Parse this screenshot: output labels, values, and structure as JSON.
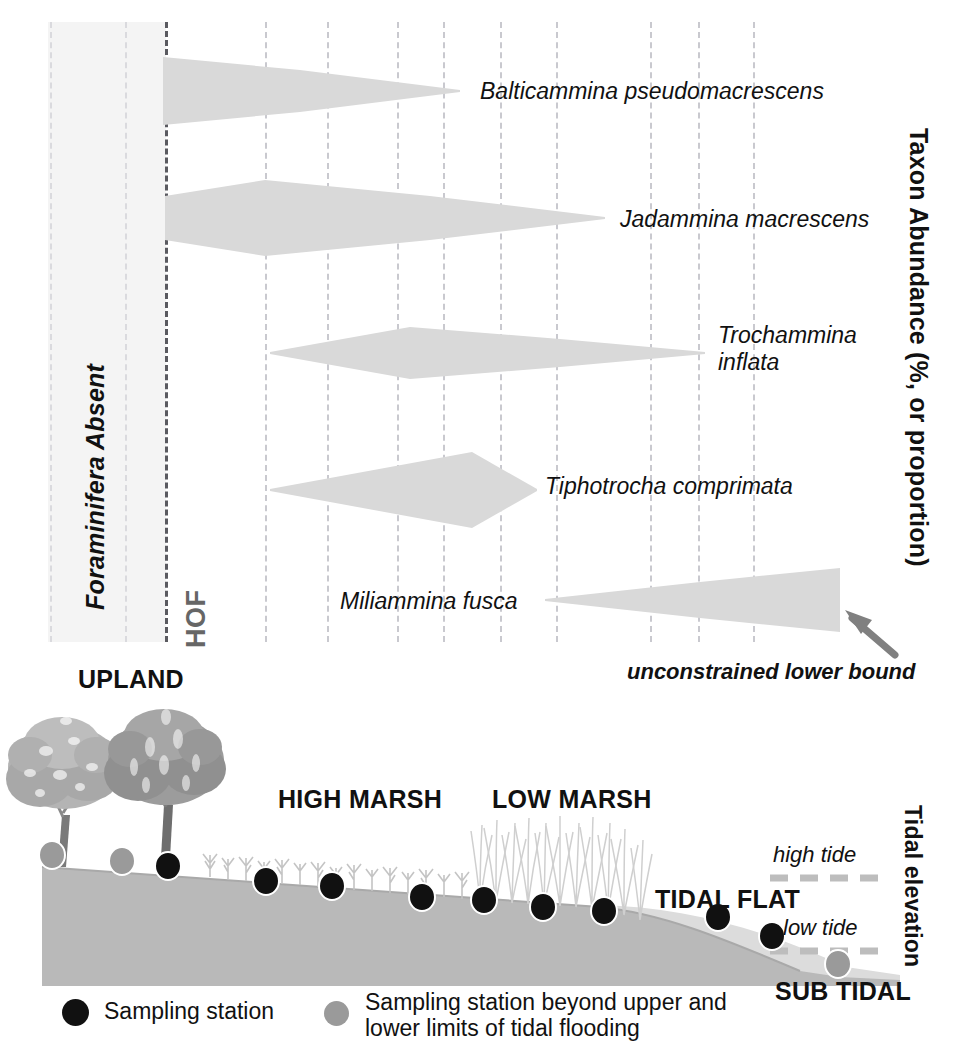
{
  "figure": {
    "title_internal": "Salt marsh foraminiferal zonation and tidal elevation cross-section"
  },
  "top_panel": {
    "absent_zone_label": "Foraminifera Absent",
    "hof_label": "HOF",
    "y_axis_label": "Taxon Abundance (%, or proportion)",
    "annotation": "unconstrained lower bound",
    "species": [
      {
        "name": "Balticammina pseudomacrescens",
        "label_lines": [
          "Balticammina pseudomacrescens"
        ]
      },
      {
        "name": "Jadammina macrescens",
        "label_lines": [
          "Jadammina macrescens"
        ]
      },
      {
        "name": "Trochammina inflata",
        "label_lines": [
          "Trochammina",
          "inflata"
        ]
      },
      {
        "name": "Tiphotrocha comprimata",
        "label_lines": [
          "Tiphotrocha comprimata"
        ]
      },
      {
        "name": "Miliammina fusca",
        "label_lines": [
          "Miliammina fusca"
        ]
      }
    ]
  },
  "bottom_panel": {
    "zone_labels": [
      "UPLAND",
      "HIGH MARSH",
      "LOW MARSH",
      "TIDAL FLAT",
      "SUB TIDAL"
    ],
    "tide_labels": [
      "high tide",
      "low tide"
    ],
    "y_axis_label": "Tidal elevation"
  },
  "legend": {
    "items": [
      {
        "marker": "black-dot",
        "text": "Sampling station"
      },
      {
        "marker": "grey-dot",
        "text_line1": "Sampling station beyond upper and",
        "text_line2": "lower limits of tidal flooding"
      }
    ]
  },
  "colors": {
    "taxon_fill": "#d9d9d9",
    "absent_band": "#f4f4f4",
    "gridline": "#c9c9cf",
    "hof_line": "#5a5a60",
    "marsh_body": "#b8b8b8",
    "tidal_flat": "#d2d2d2",
    "station_black": "#111111",
    "station_grey": "#9a9a9a",
    "arrow": "#808080",
    "tree_light": "#a8a8a8",
    "tree_dark": "#8a8a8a"
  },
  "chart_data": {
    "type": "area",
    "xlabel": "",
    "ylabel": "Taxon Abundance (%, or proportion)",
    "x_axis_note": "Tidal elevation decreasing left-to-right (upland to sub tidal)",
    "grid": true,
    "legend_position": "inline-right-labels",
    "gridline_x_positions": [
      50,
      125,
      165,
      265,
      327,
      397,
      443,
      500,
      556,
      650,
      698,
      753
    ],
    "hof_x": 165,
    "absent_zone_x_range": [
      48,
      165
    ],
    "series": [
      {
        "name": "Balticammina pseudomacrescens",
        "comment": "wedge: widest at HOF, tapers to zero seaward",
        "envelope": [
          {
            "x": 163,
            "half_width": 34
          },
          {
            "x": 300,
            "half_width": 21
          },
          {
            "x": 460,
            "half_width": 1
          }
        ],
        "center_y": 91
      },
      {
        "name": "Jadammina macrescens",
        "comment": "broad lens peaking just seaward of HOF",
        "envelope": [
          {
            "x": 165,
            "half_width": 22
          },
          {
            "x": 265,
            "half_width": 38
          },
          {
            "x": 430,
            "half_width": 22
          },
          {
            "x": 605,
            "half_width": 1
          }
        ],
        "center_y": 218
      },
      {
        "name": "Trochammina inflata",
        "comment": "elongate lens across mid marsh",
        "envelope": [
          {
            "x": 270,
            "half_width": 1
          },
          {
            "x": 410,
            "half_width": 26
          },
          {
            "x": 560,
            "half_width": 14
          },
          {
            "x": 705,
            "half_width": 1
          }
        ],
        "center_y": 353
      },
      {
        "name": "Tiphotrocha comprimata",
        "comment": "asymmetric lens peaking in low marsh",
        "envelope": [
          {
            "x": 270,
            "half_width": 1
          },
          {
            "x": 472,
            "half_width": 38
          },
          {
            "x": 537,
            "half_width": 1
          }
        ],
        "center_y": 490
      },
      {
        "name": "Miliammina fusca",
        "comment": "expanding wedge toward sub tidal, right edge unconstrained",
        "envelope": [
          {
            "x": 545,
            "half_width": 1
          },
          {
            "x": 700,
            "half_width": 18
          },
          {
            "x": 840,
            "half_width": 32
          }
        ],
        "center_y": 600
      }
    ],
    "station_markers": {
      "black": [
        {
          "x": 168,
          "y": 866
        },
        {
          "x": 266,
          "y": 881
        },
        {
          "x": 332,
          "y": 886
        },
        {
          "x": 422,
          "y": 897
        },
        {
          "x": 484,
          "y": 900
        },
        {
          "x": 543,
          "y": 907
        },
        {
          "x": 604,
          "y": 911
        },
        {
          "x": 718,
          "y": 917
        },
        {
          "x": 772,
          "y": 936
        }
      ],
      "grey": [
        {
          "x": 52,
          "y": 855
        },
        {
          "x": 122,
          "y": 861
        },
        {
          "x": 838,
          "y": 964
        }
      ]
    }
  }
}
